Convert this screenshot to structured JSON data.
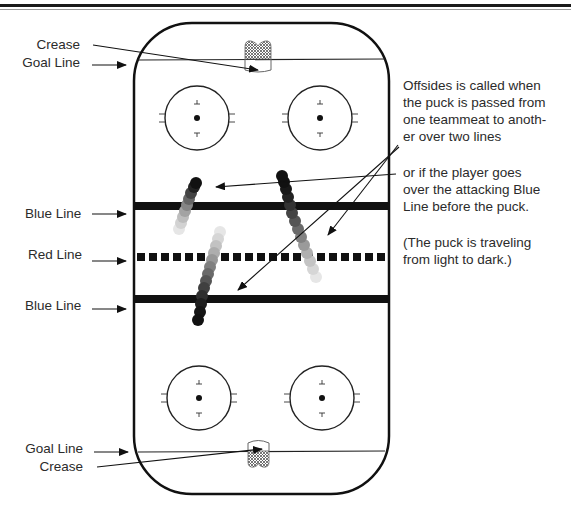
{
  "diagram": {
    "colors": {
      "line": "#111111",
      "text": "#2b2b2b",
      "puck_dark": "#111111",
      "puck_light": "#e4e4e4"
    },
    "left_labels": {
      "crease_top": "Crease",
      "goal_line_top": "Goal Line",
      "blue_line_top": "Blue Line",
      "red_line": "Red Line",
      "blue_line_bottom": "Blue Line",
      "goal_line_bottom": "Goal Line",
      "crease_bottom": "Crease"
    },
    "notes": {
      "offsides_line1": "Offsides is called when",
      "offsides_line2": "the puck is passed from",
      "offsides_line3": "one teammeat to anoth-",
      "offsides_line4": "er over two lines",
      "player_line1": "or if the player goes",
      "player_line2": "over the attacking Blue",
      "player_line3": "Line before the puck.",
      "travel_line1": "(The puck is traveling",
      "travel_line2": "from light to dark.)"
    },
    "rink_elements": {
      "faceoff_circles": 4,
      "goal_creases": 2,
      "blue_lines": 2,
      "red_line_style": "dashed",
      "puck_trails": 3
    }
  }
}
